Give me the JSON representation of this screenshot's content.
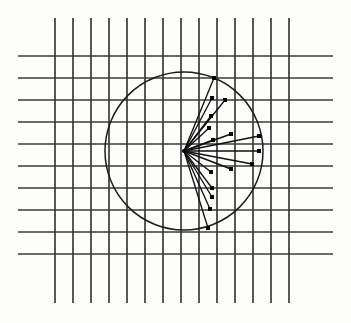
{
  "figure": {
    "kind": "scatter",
    "background_color": "#fdfdfc",
    "grid_color": "#3a3a3a",
    "stroke_color": "#111111",
    "circle_color": "#1c1c1c"
  },
  "chart_data": {
    "type": "scatter",
    "xlabel": "",
    "ylabel": "",
    "grid": true,
    "legend": null,
    "xlim": [
      0,
      351
    ],
    "ylim": [
      0,
      323
    ],
    "grid_spec": {
      "vertical_lines_x": [
        55,
        73,
        91,
        109,
        127,
        145,
        163,
        181,
        199,
        217,
        235,
        253,
        271,
        289
      ],
      "vertical_line_y_start": 18,
      "vertical_line_y_end": 303,
      "horizontal_lines_y": [
        56,
        78,
        100,
        122,
        144,
        166,
        188,
        210,
        232,
        254
      ],
      "horizontal_line_x_start": 18,
      "horizontal_line_x_end": 333,
      "vertical_spacing": 18,
      "horizontal_spacing": 22
    },
    "circle": {
      "center_x": 184,
      "center_y": 151,
      "radius": 79
    },
    "origin": {
      "x": 184,
      "y": 151
    },
    "vectors": [
      {
        "label": "v1",
        "x": 214,
        "y": 78,
        "angle_deg": 67.6,
        "length": 79
      },
      {
        "label": "v2",
        "x": 212,
        "y": 98,
        "angle_deg": 62.1,
        "length": 60
      },
      {
        "label": "v3",
        "x": 225,
        "y": 100,
        "angle_deg": 55.3,
        "length": 62
      },
      {
        "label": "v4",
        "x": 211,
        "y": 116,
        "angle_deg": 49.4,
        "length": 44
      },
      {
        "label": "v5",
        "x": 209,
        "y": 128,
        "angle_deg": 42.6,
        "length": 34
      },
      {
        "label": "v6",
        "x": 231,
        "y": 134,
        "angle_deg": 19.9,
        "length": 50
      },
      {
        "label": "v7",
        "x": 259,
        "y": 136,
        "angle_deg": 11.4,
        "length": 77
      },
      {
        "label": "v8",
        "x": 213,
        "y": 140,
        "angle_deg": 20.8,
        "length": 31
      },
      {
        "label": "v9",
        "x": 259,
        "y": 151,
        "angle_deg": 0.0,
        "length": 75
      },
      {
        "label": "v10",
        "x": 252,
        "y": 164,
        "angle_deg": -11.0,
        "length": 69
      },
      {
        "label": "v11",
        "x": 231,
        "y": 169,
        "angle_deg": -21.0,
        "length": 50
      },
      {
        "label": "v12",
        "x": 211,
        "y": 172,
        "angle_deg": -37.9,
        "length": 34
      },
      {
        "label": "v13",
        "x": 212,
        "y": 188,
        "angle_deg": -52.9,
        "length": 46
      },
      {
        "label": "v14",
        "x": 212,
        "y": 197,
        "angle_deg": -58.6,
        "length": 54
      },
      {
        "label": "v15",
        "x": 210,
        "y": 209,
        "angle_deg": -65.8,
        "length": 64
      },
      {
        "label": "v16",
        "x": 208,
        "y": 228,
        "angle_deg": -72.7,
        "length": 81
      }
    ]
  }
}
